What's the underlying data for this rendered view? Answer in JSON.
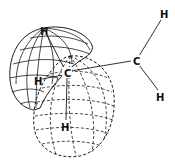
{
  "diagram": {
    "type": "molecular-orbital",
    "colors": {
      "stroke": "#1a1a1a",
      "background": "#ffffff"
    },
    "atoms": [
      {
        "id": "c1",
        "label": "C",
        "x": 67,
        "y": 73
      },
      {
        "id": "c2",
        "label": "C",
        "x": 136,
        "y": 61
      },
      {
        "id": "h1",
        "label": "H",
        "x": 44,
        "y": 31
      },
      {
        "id": "h2",
        "label": "H",
        "x": 37,
        "y": 81
      },
      {
        "id": "h3",
        "label": "H",
        "x": 65,
        "y": 127
      },
      {
        "id": "h4",
        "label": "H",
        "x": 164,
        "y": 15
      },
      {
        "id": "h5",
        "label": "H",
        "x": 160,
        "y": 97
      }
    ],
    "bonds": [
      [
        "c1",
        "c2"
      ],
      [
        "c1",
        "h1"
      ],
      [
        "c1",
        "h2"
      ],
      [
        "c1",
        "h3"
      ],
      [
        "c2",
        "h4"
      ],
      [
        "c2",
        "h5"
      ]
    ],
    "lobes": [
      {
        "name": "solid-lobe",
        "style": "solid"
      },
      {
        "name": "dashed-lobe",
        "style": "dashed"
      }
    ]
  }
}
